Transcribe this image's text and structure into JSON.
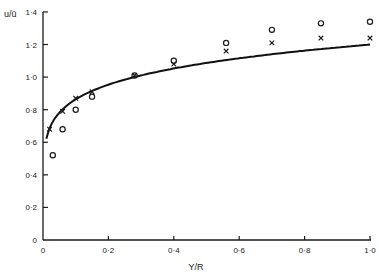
{
  "chart_data": {
    "type": "scatter",
    "title": "",
    "xlabel": "Y/R",
    "ylabel": "u/ū",
    "xlim": [
      0,
      1.0
    ],
    "ylim": [
      0,
      1.4
    ],
    "grid": false,
    "legend": null,
    "x_ticks": [
      "0",
      "0·2",
      "0·4",
      "0·6",
      "0·8",
      "1·0"
    ],
    "y_ticks": [
      "0",
      "0·2",
      "0·4",
      "0·6",
      "0·8",
      "1·0",
      "1·2",
      "1·4"
    ],
    "series": [
      {
        "name": "crosses",
        "marker": "x",
        "points": [
          [
            0.02,
            0.68
          ],
          [
            0.06,
            0.79
          ],
          [
            0.1,
            0.87
          ],
          [
            0.15,
            0.91
          ],
          [
            0.28,
            1.01
          ],
          [
            0.4,
            1.08
          ],
          [
            0.56,
            1.16
          ],
          [
            0.7,
            1.21
          ],
          [
            0.85,
            1.24
          ],
          [
            1.0,
            1.24
          ]
        ]
      },
      {
        "name": "circles",
        "marker": "o",
        "points": [
          [
            0.03,
            0.52
          ],
          [
            0.06,
            0.68
          ],
          [
            0.1,
            0.8
          ],
          [
            0.15,
            0.88
          ],
          [
            0.28,
            1.01
          ],
          [
            0.4,
            1.1
          ],
          [
            0.56,
            1.21
          ],
          [
            0.7,
            1.29
          ],
          [
            0.85,
            1.33
          ],
          [
            1.0,
            1.34
          ]
        ]
      },
      {
        "name": "curve",
        "marker": "line",
        "points": [
          [
            0.01,
            0.64
          ],
          [
            0.02,
            0.7
          ],
          [
            0.04,
            0.77
          ],
          [
            0.06,
            0.82
          ],
          [
            0.08,
            0.85
          ],
          [
            0.1,
            0.88
          ],
          [
            0.15,
            0.93
          ],
          [
            0.2,
            0.97
          ],
          [
            0.28,
            1.02
          ],
          [
            0.4,
            1.07
          ],
          [
            0.56,
            1.12
          ],
          [
            0.7,
            1.16
          ],
          [
            0.85,
            1.19
          ],
          [
            1.0,
            1.2
          ]
        ]
      }
    ]
  }
}
